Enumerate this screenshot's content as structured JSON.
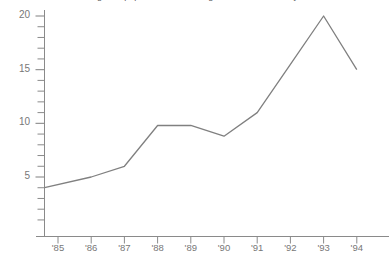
{
  "chart_data": {
    "type": "line",
    "title": "Changes in population at Eastridge National over ten years",
    "xlabel": "",
    "ylabel": "",
    "categories": [
      "'85",
      "'86",
      "'87",
      "'88",
      "'89",
      "'90",
      "'91",
      "'92",
      "'93",
      "'94"
    ],
    "values": [
      4,
      5,
      6,
      9.8,
      9.8,
      8.8,
      11,
      15.5,
      20,
      15
    ],
    "series": [
      {
        "name": "population",
        "values": [
          4,
          5,
          6,
          9.8,
          9.8,
          8.8,
          11,
          15.5,
          20,
          15
        ]
      }
    ],
    "ylim": [
      0,
      21
    ],
    "yticks": [
      5,
      10,
      15,
      20
    ],
    "ytick_labels": [
      "5",
      "10",
      "15",
      "20"
    ],
    "yminor_step": 1,
    "grid": false,
    "legend": "none",
    "line_color": "#808080",
    "axis_color": "#8a8a8a",
    "text_color": "#777777",
    "background": "#ffffff"
  }
}
